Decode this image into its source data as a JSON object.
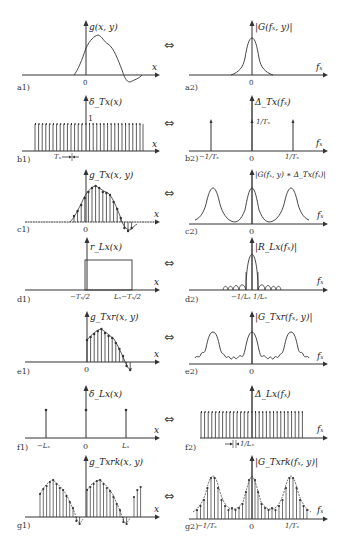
{
  "figure": {
    "rows": [
      {
        "left": {
          "id": "a1",
          "tag": "a1)",
          "func": "g(x, y)",
          "axis": "x",
          "ticks": [
            "0"
          ]
        },
        "right": {
          "id": "a2",
          "tag": "a2)",
          "func": "|G(fₓ, y)|",
          "axis": "fₓ",
          "ticks": [
            "0"
          ]
        }
      },
      {
        "left": {
          "id": "b1",
          "tag": "b1)",
          "func": "δ_Tx(x)",
          "axis": "x",
          "ticks": [
            "1",
            "Tₓ"
          ]
        },
        "right": {
          "id": "b2",
          "tag": "b2)",
          "func": "Δ_Tx(fₓ)",
          "axis": "fₓ",
          "ticks": [
            "−1/Tₓ",
            "0",
            "1/Tₓ",
            "1/Tₓ"
          ]
        }
      },
      {
        "left": {
          "id": "c1",
          "tag": "c1)",
          "func": "g_Tx(x, y)",
          "axis": "x",
          "ticks": [
            "0"
          ]
        },
        "right": {
          "id": "c2",
          "tag": "c2)",
          "func": "|G(fₓ, y) ∗ Δ_Tx(fₓ)|",
          "axis": "fₓ",
          "ticks": [
            "0"
          ]
        }
      },
      {
        "left": {
          "id": "d1",
          "tag": "d1)",
          "func": "r_Lx(x)",
          "axis": "x",
          "ticks": [
            "−Tₓ/2",
            "Lₓ−Tₓ/2"
          ]
        },
        "right": {
          "id": "d2",
          "tag": "d2)",
          "func": "|R_Lx(fₓ)|",
          "axis": "fₓ",
          "ticks": [
            "−1/Lₓ",
            "1/Lₓ"
          ]
        }
      },
      {
        "left": {
          "id": "e1",
          "tag": "e1)",
          "func": "g_Txr(x, y)",
          "axis": "x",
          "ticks": [
            "0"
          ]
        },
        "right": {
          "id": "e2",
          "tag": "e2)",
          "func": "|G_Txr(fₓ, y)|",
          "axis": "fₓ",
          "ticks": [
            "0"
          ]
        }
      },
      {
        "left": {
          "id": "f1",
          "tag": "f1)",
          "func": "δ_Lx(x)",
          "axis": "x",
          "ticks": [
            "−Lₓ",
            "0",
            "Lₓ"
          ]
        },
        "right": {
          "id": "f2",
          "tag": "f2)",
          "func": "Δ_Lx(fₓ)",
          "axis": "fₓ",
          "ticks": [
            "1/Lₓ"
          ]
        }
      },
      {
        "left": {
          "id": "g1",
          "tag": "g1)",
          "func": "g_Txrk(x, y)",
          "axis": "x",
          "ticks": []
        },
        "right": {
          "id": "g2",
          "tag": "g2)",
          "func": "|G_Txrk(fₓ, y)|",
          "axis": "fₓ",
          "ticks": [
            "−1/Tₓ",
            "0",
            "1/Tₓ"
          ]
        }
      }
    ],
    "transform_symbol": "⇔"
  }
}
